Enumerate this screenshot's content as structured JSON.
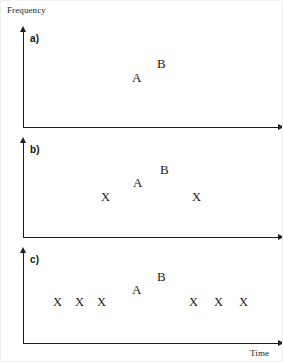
{
  "figure": {
    "width": 283,
    "height": 362,
    "background": "#ffffff",
    "axis_color": "#1f1f1f",
    "text_color": "#1a1a1a"
  },
  "axes": {
    "y_label": "Frequency",
    "x_label": "Time"
  },
  "panels": [
    {
      "id": "a",
      "label": "a)",
      "y_axis": {
        "x": 22,
        "top": 30,
        "bottom": 126
      },
      "x_axis": {
        "y": 126,
        "left": 22,
        "right": 277
      },
      "markers": [
        {
          "text": "A",
          "x": 131,
          "y": 70,
          "kind": "letter"
        },
        {
          "text": "B",
          "x": 156,
          "y": 56,
          "kind": "letter"
        }
      ]
    },
    {
      "id": "b",
      "label": "b)",
      "y_axis": {
        "x": 22,
        "top": 141,
        "bottom": 236
      },
      "x_axis": {
        "y": 236,
        "left": 22,
        "right": 277
      },
      "markers": [
        {
          "text": "X",
          "x": 100,
          "y": 190,
          "kind": "x"
        },
        {
          "text": "A",
          "x": 132,
          "y": 175,
          "kind": "letter"
        },
        {
          "text": "B",
          "x": 159,
          "y": 162,
          "kind": "letter"
        },
        {
          "text": "X",
          "x": 191,
          "y": 190,
          "kind": "x"
        }
      ]
    },
    {
      "id": "c",
      "label": "c)",
      "y_axis": {
        "x": 22,
        "top": 251,
        "bottom": 342
      },
      "x_axis": {
        "y": 342,
        "left": 22,
        "right": 277
      },
      "markers": [
        {
          "text": "X",
          "x": 52,
          "y": 295,
          "kind": "x"
        },
        {
          "text": "X",
          "x": 74,
          "y": 295,
          "kind": "x"
        },
        {
          "text": "X",
          "x": 96,
          "y": 295,
          "kind": "x"
        },
        {
          "text": "A",
          "x": 131,
          "y": 282,
          "kind": "letter"
        },
        {
          "text": "B",
          "x": 156,
          "y": 269,
          "kind": "letter"
        },
        {
          "text": "X",
          "x": 188,
          "y": 295,
          "kind": "x"
        },
        {
          "text": "X",
          "x": 213,
          "y": 295,
          "kind": "x"
        },
        {
          "text": "X",
          "x": 238,
          "y": 295,
          "kind": "x"
        }
      ]
    }
  ],
  "chart_data": {
    "type": "scatter",
    "title": "",
    "xlabel": "Time",
    "ylabel": "Frequency",
    "grid": false,
    "legend": "none",
    "subplots": [
      {
        "id": "a",
        "label": "a)",
        "points": [
          {
            "label": "A",
            "x": 0.44,
            "y": 0.58
          },
          {
            "label": "B",
            "x": 0.54,
            "y": 0.72
          }
        ]
      },
      {
        "id": "b",
        "label": "b)",
        "points": [
          {
            "label": "X",
            "x": 0.32,
            "y": 0.48
          },
          {
            "label": "A",
            "x": 0.44,
            "y": 0.63
          },
          {
            "label": "B",
            "x": 0.55,
            "y": 0.77
          },
          {
            "label": "X",
            "x": 0.68,
            "y": 0.48
          }
        ]
      },
      {
        "id": "c",
        "label": "c)",
        "points": [
          {
            "label": "X",
            "x": 0.13,
            "y": 0.5
          },
          {
            "label": "X",
            "x": 0.21,
            "y": 0.5
          },
          {
            "label": "X",
            "x": 0.3,
            "y": 0.5
          },
          {
            "label": "A",
            "x": 0.44,
            "y": 0.64
          },
          {
            "label": "B",
            "x": 0.54,
            "y": 0.78
          },
          {
            "label": "X",
            "x": 0.66,
            "y": 0.5
          },
          {
            "label": "X",
            "x": 0.76,
            "y": 0.5
          },
          {
            "label": "X",
            "x": 0.86,
            "y": 0.5
          }
        ]
      }
    ]
  }
}
